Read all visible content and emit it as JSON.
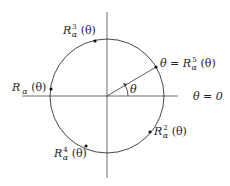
{
  "diagram": {
    "type": "unit-circle-rotation",
    "center": {
      "x": 107,
      "y": 96
    },
    "radius": 57,
    "axes": {
      "horizontal": {
        "x1": 22,
        "x2": 178,
        "y": 96
      },
      "vertical": {
        "x": 107,
        "y1": 12,
        "y2": 178
      }
    },
    "angle_label": "θ",
    "zero_label": "θ = 0",
    "points": [
      {
        "id": "theta",
        "label_main": "θ = R",
        "label_sup": "5",
        "label_sub": "α",
        "label_tail": " (θ)",
        "x": 156,
        "y": 67
      },
      {
        "id": "r1",
        "label_main": "R",
        "label_sup": "",
        "label_sub": "α",
        "label_tail": " (θ)",
        "x": 51,
        "y": 89
      },
      {
        "id": "r2",
        "label_main": "R",
        "label_sup": "2",
        "label_sub": "α",
        "label_tail": " (θ)",
        "x": 150,
        "y": 132
      },
      {
        "id": "r3",
        "label_main": "R",
        "label_sup": "3",
        "label_sub": "α",
        "label_tail": " (θ)",
        "x": 95,
        "y": 41
      },
      {
        "id": "r4",
        "label_main": "R",
        "label_sup": "4",
        "label_sub": "α",
        "label_tail": " (θ)",
        "x": 86,
        "y": 146
      }
    ],
    "colors": {
      "stroke": "#333333",
      "dot": "#111111",
      "text": "#222222"
    }
  }
}
